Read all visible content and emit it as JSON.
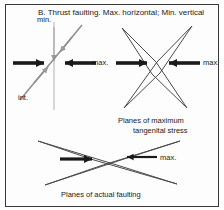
{
  "figure": {
    "title": "B. Thrust faulting. Max. horizontal; Min. vertical",
    "border_color": "#3a3a3a",
    "background": "#fdfdfd",
    "panels": {
      "stress_axes": {
        "name": "stress axes diagram",
        "labels": {
          "min": "min.",
          "int": "int.",
          "max": "max."
        },
        "axis_color": "#9a9a9a",
        "arrow_color": "#1a1a1a"
      },
      "tangential_planes": {
        "name": "planes of maximum tangential stress",
        "caption_line1": "Planes of maximum",
        "caption_line2": "tangenital stress",
        "label_max": "max.",
        "plane_color": "#4a4a4a",
        "arrow_color": "#1a1a1a"
      },
      "actual_faulting": {
        "name": "planes of actual faulting",
        "caption": "Planes of actual faulting",
        "label_max": "max.",
        "plane_color": "#4a4a4a",
        "arrow_color": "#1a1a1a"
      }
    }
  }
}
